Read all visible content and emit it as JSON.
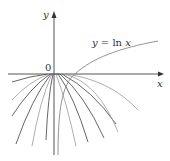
{
  "diagram": {
    "axes": {
      "x_label": "x",
      "y_label": "y",
      "origin_label": "0"
    },
    "curve_label": {
      "lhs": "y",
      "eq": " = ",
      "fn": "ln",
      "var": " x"
    },
    "curves": {
      "main": "y = ln x",
      "family": "downward-opening parabolas tangent near origin"
    },
    "colors": {
      "axis": "#555555",
      "curve_dark": "#555555",
      "curve_light": "#999999",
      "ln_curve": "#888888",
      "background": "#ffffff"
    }
  }
}
